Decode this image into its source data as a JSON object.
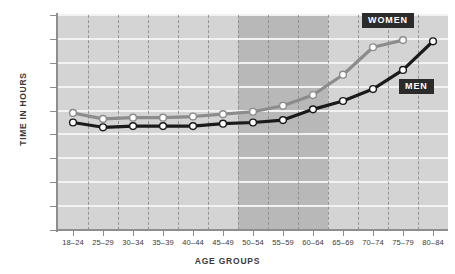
{
  "chart_data": {
    "type": "line",
    "title": "",
    "xlabel": "AGE GROUPS",
    "ylabel": "TIME IN HOURS",
    "categories": [
      "18–24",
      "25–29",
      "30–34",
      "35–39",
      "40–44",
      "45–49",
      "50–54",
      "55–59",
      "60–64",
      "65–69",
      "70–74",
      "75–79",
      "80–84"
    ],
    "ylim": [
      0,
      18
    ],
    "yticks": [
      0,
      2,
      4,
      6,
      8,
      10,
      12,
      14,
      16,
      18
    ],
    "ytick_labels": [
      "0",
      "2",
      "4",
      "6",
      "8",
      "10",
      "12",
      "14",
      "16",
      "18"
    ],
    "grid": "horizontal-and-dashed-vertical",
    "legend_position": "inline-labels",
    "shaded_band": {
      "from": "50–54",
      "to": "60–64",
      "color": "#b8b8b8"
    },
    "plot_background": "#d4d4d4",
    "series": [
      {
        "name": "WOMEN",
        "color": "#8c8c8c",
        "marker": "white-circle",
        "values": [
          9.8,
          9.3,
          9.4,
          9.4,
          9.5,
          9.7,
          9.9,
          10.4,
          11.3,
          13.0,
          15.3,
          15.9,
          null
        ]
      },
      {
        "name": "MEN",
        "color": "#1a1a1a",
        "marker": "white-circle",
        "values": [
          9.0,
          8.6,
          8.7,
          8.7,
          8.7,
          8.9,
          9.0,
          9.2,
          10.1,
          10.8,
          11.8,
          13.4,
          15.8
        ]
      }
    ]
  },
  "legend": {
    "women_label": "WOMEN",
    "men_label": "MEN",
    "chip_background": "#2b2b2b",
    "chip_text_color": "#ffffff"
  },
  "axis_titles": {
    "y": "TIME IN HOURS",
    "x": "AGE GROUPS"
  }
}
